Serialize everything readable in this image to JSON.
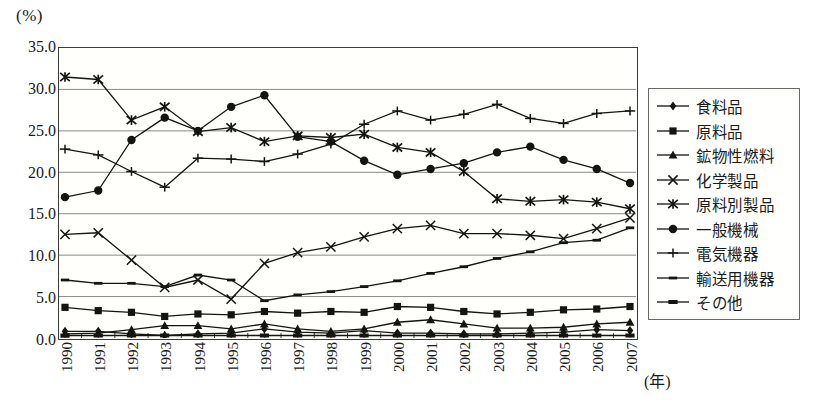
{
  "axis": {
    "unit_label": "(%)",
    "x_unit_label": "(年)",
    "y_ticks": [
      "0.0",
      "5.0",
      "10.0",
      "15.0",
      "20.0",
      "25.0",
      "30.0",
      "35.0"
    ]
  },
  "legend": {
    "items": [
      {
        "label": "食料品",
        "marker": "diamond"
      },
      {
        "label": "原料品",
        "marker": "square"
      },
      {
        "label": "鉱物性燃料",
        "marker": "triangle"
      },
      {
        "label": "化学製品",
        "marker": "cross"
      },
      {
        "label": "原料別製品",
        "marker": "asterisk"
      },
      {
        "label": "一般機械",
        "marker": "circle"
      },
      {
        "label": "電気機器",
        "marker": "plus"
      },
      {
        "label": "輸送用機器",
        "marker": "dash"
      },
      {
        "label": "その他",
        "marker": "thickdash"
      }
    ]
  },
  "chart_data": {
    "type": "line",
    "title": "",
    "xlabel": "(年)",
    "ylabel": "(%)",
    "ylim": [
      0,
      35
    ],
    "ytick_step": 5,
    "grid": true,
    "legend_position": "right",
    "categories": [
      1990,
      1991,
      1992,
      1993,
      1994,
      1995,
      1996,
      1997,
      1998,
      1999,
      2000,
      2001,
      2002,
      2003,
      2004,
      2005,
      2006,
      2007
    ],
    "series": [
      {
        "name": "食料品",
        "marker": "diamond",
        "values": [
          0.8,
          0.8,
          0.5,
          0.3,
          0.5,
          0.6,
          1.1,
          0.7,
          0.6,
          0.9,
          0.6,
          0.6,
          0.5,
          0.5,
          0.6,
          0.7,
          1.0,
          0.9
        ]
      },
      {
        "name": "原料品",
        "marker": "square",
        "values": [
          3.7,
          3.3,
          3.1,
          2.6,
          2.9,
          2.8,
          3.2,
          3.0,
          3.2,
          3.1,
          3.8,
          3.7,
          3.2,
          2.9,
          3.1,
          3.4,
          3.5,
          3.8
        ]
      },
      {
        "name": "鉱物性燃料",
        "marker": "triangle",
        "values": [
          0.5,
          0.6,
          1.0,
          1.5,
          1.5,
          1.1,
          1.7,
          1.1,
          0.8,
          1.1,
          1.9,
          2.2,
          1.7,
          1.2,
          1.2,
          1.3,
          1.7,
          1.9
        ]
      },
      {
        "name": "化学製品",
        "marker": "cross",
        "values": [
          12.5,
          12.7,
          9.4,
          6.1,
          7.0,
          4.7,
          9.0,
          10.3,
          11.0,
          12.2,
          13.2,
          13.6,
          12.6,
          12.6,
          12.4,
          12.0,
          13.2,
          14.5
        ]
      },
      {
        "name": "原料別製品",
        "marker": "asterisk",
        "values": [
          31.5,
          31.2,
          26.3,
          27.9,
          24.9,
          25.4,
          23.7,
          24.4,
          24.2,
          24.6,
          23.0,
          22.4,
          20.1,
          16.8,
          16.5,
          16.7,
          16.4,
          15.6
        ]
      },
      {
        "name": "一般機械",
        "marker": "circle",
        "values": [
          17.0,
          17.8,
          23.9,
          26.6,
          25.0,
          27.9,
          29.3,
          24.3,
          23.7,
          21.4,
          19.7,
          20.4,
          21.1,
          22.4,
          23.1,
          21.5,
          20.4,
          18.7
        ]
      },
      {
        "name": "電気機器",
        "marker": "plus",
        "values": [
          22.8,
          22.1,
          20.1,
          18.2,
          21.7,
          21.6,
          21.3,
          22.2,
          23.4,
          25.8,
          27.4,
          26.3,
          27.0,
          28.2,
          26.5,
          25.9,
          27.1,
          27.4
        ]
      },
      {
        "name": "輸送用機器",
        "marker": "dash",
        "values": [
          7.0,
          6.6,
          6.6,
          6.2,
          7.6,
          7.0,
          4.5,
          5.2,
          5.6,
          6.2,
          6.9,
          7.8,
          8.6,
          9.6,
          10.4,
          11.5,
          11.8,
          13.3
        ]
      },
      {
        "name": "その他",
        "marker": "thickdash",
        "values": [
          0.3,
          0.3,
          0.3,
          0.3,
          0.3,
          0.3,
          0.3,
          0.3,
          0.3,
          0.3,
          0.3,
          0.3,
          0.3,
          0.3,
          0.3,
          0.3,
          0.3,
          0.3
        ]
      }
    ]
  }
}
